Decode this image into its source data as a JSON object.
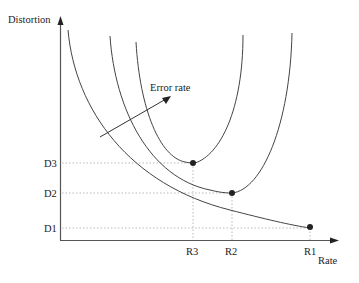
{
  "diagram": {
    "y_axis_label": "Distortion",
    "x_axis_label": "Rate",
    "arrow_label": "Error rate",
    "y_ticks": [
      "D3",
      "D2",
      "D1"
    ],
    "x_ticks": [
      "R3",
      "R2",
      "R1"
    ],
    "curves": [
      {
        "name": "curve-1",
        "min_point": {
          "rate": "R1",
          "distortion": "D1"
        }
      },
      {
        "name": "curve-2",
        "min_point": {
          "rate": "R2",
          "distortion": "D2"
        }
      },
      {
        "name": "curve-3",
        "min_point": {
          "rate": "R3",
          "distortion": "D3"
        }
      }
    ],
    "colors": {
      "curve": "#444444",
      "guide": "#bbbbbb",
      "dot": "#222222"
    }
  }
}
